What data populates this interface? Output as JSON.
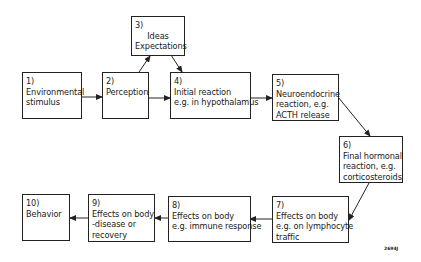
{
  "diagram": {
    "type": "flowchart",
    "nodes": [
      {
        "id": "1",
        "num": "1)",
        "lines": [
          "Environmental",
          "stimulus"
        ]
      },
      {
        "id": "2",
        "num": "2)",
        "lines": [
          "Perception"
        ]
      },
      {
        "id": "3",
        "num": "3)",
        "lines": [
          "Ideas",
          "Expectations"
        ]
      },
      {
        "id": "4",
        "num": "4)",
        "lines": [
          "Initial reaction",
          "e.g. in hypothalamus"
        ]
      },
      {
        "id": "5",
        "num": "5)",
        "lines": [
          "Neuroendocrine",
          "reaction, e.g.",
          "ACTH release"
        ]
      },
      {
        "id": "6",
        "num": "6)",
        "lines": [
          "Final hormonal",
          "reaction, e.g.",
          "corticosteroids"
        ]
      },
      {
        "id": "7",
        "num": "7)",
        "lines": [
          "Effects on body",
          "e.g. on lymphocyte",
          "traffic"
        ]
      },
      {
        "id": "8",
        "num": "8)",
        "lines": [
          "Effects on body",
          "e.g. immune response"
        ]
      },
      {
        "id": "9",
        "num": "9)",
        "lines": [
          "Effects on body",
          "-disease or",
          "recovery"
        ]
      },
      {
        "id": "10",
        "num": "10)",
        "lines": [
          "Behavior"
        ]
      }
    ],
    "edges": [
      {
        "from": "1",
        "to": "2"
      },
      {
        "from": "2",
        "to": "3"
      },
      {
        "from": "3",
        "to": "4"
      },
      {
        "from": "2",
        "to": "4"
      },
      {
        "from": "4",
        "to": "5"
      },
      {
        "from": "5",
        "to": "6"
      },
      {
        "from": "6",
        "to": "7"
      },
      {
        "from": "7",
        "to": "8"
      },
      {
        "from": "8",
        "to": "9"
      },
      {
        "from": "9",
        "to": "10"
      }
    ],
    "figure_id": "2694J"
  }
}
